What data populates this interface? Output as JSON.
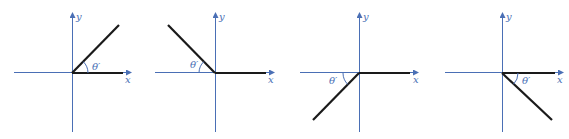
{
  "figure": {
    "x_axis_label": "x",
    "y_axis_label": "y",
    "angle_label": "θ′",
    "colors": {
      "axis": "#4a6fb5",
      "ray": "#1a1a1a",
      "background": "#ffffff"
    },
    "panels": [
      {
        "name": "quadrant-1",
        "ray_direction": "upper-right",
        "reference_angle_side": "between ray and positive x-axis"
      },
      {
        "name": "quadrant-2",
        "ray_direction": "upper-left",
        "reference_angle_side": "between ray and negative x-axis"
      },
      {
        "name": "quadrant-3",
        "ray_direction": "lower-left",
        "reference_angle_side": "between ray and negative x-axis"
      },
      {
        "name": "quadrant-4",
        "ray_direction": "lower-right",
        "reference_angle_side": "between ray and positive x-axis"
      }
    ]
  }
}
